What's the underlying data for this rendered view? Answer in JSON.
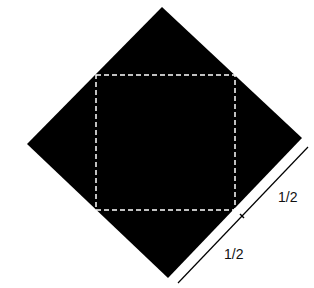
{
  "diagram": {
    "colors": {
      "shape_fill": "#000000",
      "dashed_square": "#ffffff",
      "measure_line": "#000000",
      "background": "#ffffff"
    },
    "labels": {
      "upper_half": "1/2",
      "lower_half": "1/2"
    }
  }
}
